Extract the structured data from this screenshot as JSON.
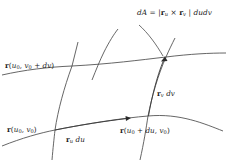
{
  "figure": {
    "background_color": "#ffffff",
    "line_color": "#4a4a4a",
    "text_color": "#1a1a1a",
    "labels": {
      "formula": {
        "text": "dA = | r_u × r_v | du dv",
        "parts": {
          "dA": "dA",
          "equals": "=",
          "bar_open": "|",
          "r": "r",
          "sub_u": "u",
          "cross": "×",
          "r2": "r",
          "sub_v": "v",
          "bar_close": "|",
          "du": "du",
          "dv": "dv"
        }
      },
      "corner_top_left": {
        "text": "r(u0, v0 + dv)",
        "parts": {
          "r": "r",
          "paren_open": "(",
          "u": "u",
          "sub_0": "0",
          "comma": ",",
          "v": "v",
          "sub_0b": "0",
          "plus": "+",
          "dv": "dv",
          "paren_close": ")"
        }
      },
      "corner_bottom_left": {
        "text": "r(u0, v0)",
        "parts": {
          "r": "r",
          "paren_open": "(",
          "u": "u",
          "sub_0": "0",
          "comma": ",",
          "v": "v",
          "sub_0b": "0",
          "paren_close": ")"
        }
      },
      "corner_bottom_right": {
        "text": "r(u0 + du, v0)",
        "parts": {
          "r": "r",
          "paren_open": "(",
          "u": "u",
          "sub_0": "0",
          "plus": "+",
          "du": "du",
          "comma": ",",
          "v": "v",
          "sub_0b": "0",
          "paren_close": ")"
        }
      },
      "vector_u": {
        "text": "r_u du",
        "parts": {
          "r": "r",
          "sub_u": "u",
          "du": "du"
        }
      },
      "vector_v": {
        "text": "r_v dv",
        "parts": {
          "r": "r",
          "sub_v": "v",
          "dv": "dv"
        }
      }
    },
    "geometry": {
      "corners": {
        "bottom_left": [
          55,
          130
        ],
        "bottom_right": [
          148,
          116
        ],
        "top_right": [
          166,
          57
        ],
        "top_left": [
          72,
          66
        ]
      },
      "arrowheads": [
        {
          "name": "u-direction-arrowhead",
          "at": [
            128,
            118
          ]
        },
        {
          "name": "v-direction-arrowhead",
          "at": [
            165,
            57
          ]
        }
      ]
    }
  }
}
